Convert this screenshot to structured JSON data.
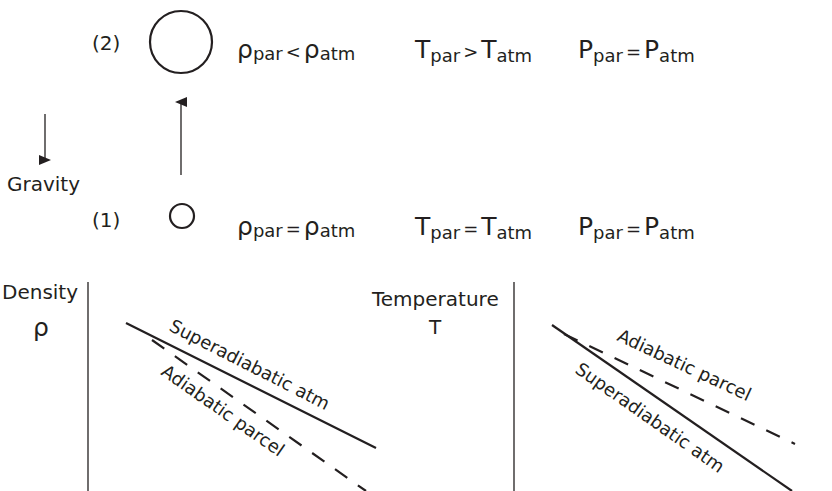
{
  "states": [
    {
      "id": "state-2",
      "label": "(2)",
      "density": {
        "symbol": "ρ",
        "sub_left": "par",
        "op": "<",
        "sub_right": "atm"
      },
      "temperature": {
        "symbol": "T",
        "sub_left": "par",
        "op": ">",
        "sub_right": "atm"
      },
      "pressure": {
        "symbol": "P",
        "sub_left": "par",
        "op": "=",
        "sub_right": "atm"
      }
    },
    {
      "id": "state-1",
      "label": "(1)",
      "density": {
        "symbol": "ρ",
        "sub_left": "par",
        "op": "=",
        "sub_right": "atm"
      },
      "temperature": {
        "symbol": "T",
        "sub_left": "par",
        "op": "=",
        "sub_right": "atm"
      },
      "pressure": {
        "symbol": "P",
        "sub_left": "par",
        "op": "=",
        "sub_right": "atm"
      }
    }
  ],
  "gravity": {
    "label": "Gravity"
  },
  "density_plot": {
    "ylabel": "Density",
    "ysymbol": "ρ",
    "solid_label": "Superadiabatic atm",
    "dashed_label": "Adiabatic parcel"
  },
  "temperature_plot": {
    "ylabel": "Temperature",
    "ysymbol": "T",
    "solid_label": "Superadiabatic atm",
    "dashed_label": "Adiabatic parcel"
  },
  "colors": {
    "ink": "#231f20",
    "background": "#ffffff"
  }
}
